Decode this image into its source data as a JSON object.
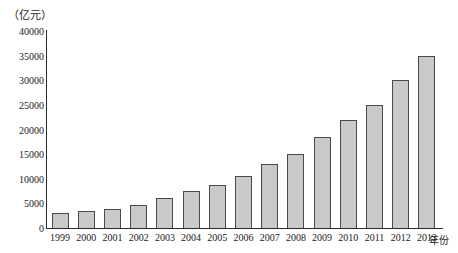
{
  "chart_data": {
    "type": "bar",
    "title": "",
    "subtitle": "",
    "xlabel": "年份",
    "ylabel": "（亿元）",
    "ylim": [
      0,
      40000
    ],
    "yticks": [
      0,
      5000,
      10000,
      15000,
      20000,
      25000,
      30000,
      35000,
      40000
    ],
    "ytick_labels": [
      "0",
      "5000",
      "10000",
      "15000",
      "20000",
      "25000",
      "30000",
      "35000",
      "40000"
    ],
    "grid": false,
    "legend": null,
    "categories": [
      "1999",
      "2000",
      "2001",
      "2002",
      "2003",
      "2004",
      "2005",
      "2006",
      "2007",
      "2008",
      "2009",
      "2010",
      "2011",
      "2012",
      "2013"
    ],
    "values": [
      3100,
      3500,
      3900,
      4600,
      6000,
      7500,
      8700,
      10500,
      13000,
      15000,
      18500,
      22000,
      25000,
      30000,
      35000
    ],
    "bar_fill_color": "#c9c9c9",
    "bar_edge_color": "#4a4a4a",
    "axis_color": "#2b2b2b",
    "background_color": "#ffffff"
  }
}
